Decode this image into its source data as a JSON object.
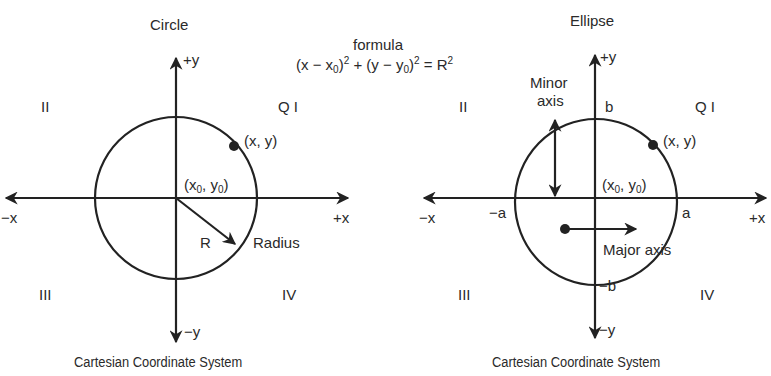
{
  "formula": {
    "heading": "formula",
    "text": "(x − x0)2 + (y − y0)2 = R2"
  },
  "circle_diagram": {
    "title": "Circle",
    "axis_labels": {
      "pos_y": "+y",
      "neg_y": "−y",
      "pos_x": "+x",
      "neg_x": "−x"
    },
    "quadrants": {
      "q1": "Q I",
      "q2": "II",
      "q3": "III",
      "q4": "IV"
    },
    "point_label": "(x, y)",
    "center_label": "(x0, y0)",
    "radius_symbol": "R",
    "radius_label": "Radius",
    "caption": "Cartesian Coordinate System"
  },
  "ellipse_diagram": {
    "title": "Ellipse",
    "axis_labels": {
      "pos_y": "+y",
      "neg_y": "−y",
      "pos_x": "+x",
      "neg_x": "−x"
    },
    "quadrants": {
      "q1": "Q I",
      "q2": "II",
      "q3": "III",
      "q4": "IV"
    },
    "point_label": "(x, y)",
    "center_label": "(x0, y0)",
    "intercepts": {
      "b": "b",
      "neg_b": "−b",
      "a": "a",
      "neg_a": "−a"
    },
    "minor_axis_label": [
      "Minor",
      "axis"
    ],
    "major_axis_label": "Major axis",
    "caption": "Cartesian Coordinate System"
  },
  "colors": {
    "ink": "#2a2a2a",
    "background": "#ffffff"
  }
}
